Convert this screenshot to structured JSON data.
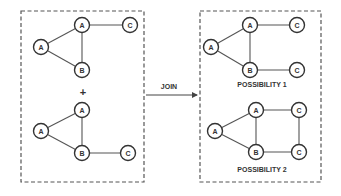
{
  "colors": {
    "stroke": "#555555",
    "node_stroke": "#333333",
    "background": "#ffffff"
  },
  "left_panel": {
    "operator": "+",
    "graph_top": {
      "nodes": [
        {
          "id": "a1",
          "label": "A",
          "x": 41,
          "y": 47
        },
        {
          "id": "a2",
          "label": "A",
          "x": 82,
          "y": 25
        },
        {
          "id": "c1",
          "label": "C",
          "x": 130,
          "y": 25
        },
        {
          "id": "b1",
          "label": "B",
          "x": 82,
          "y": 70
        }
      ],
      "edges": [
        [
          "a1",
          "a2"
        ],
        [
          "a1",
          "b1"
        ],
        [
          "a2",
          "b1"
        ],
        [
          "a2",
          "c1"
        ]
      ]
    },
    "graph_bottom": {
      "nodes": [
        {
          "id": "a1",
          "label": "A",
          "x": 41,
          "y": 131
        },
        {
          "id": "a2",
          "label": "A",
          "x": 82,
          "y": 110
        },
        {
          "id": "b1",
          "label": "B",
          "x": 82,
          "y": 153
        },
        {
          "id": "c1",
          "label": "C",
          "x": 128,
          "y": 153
        }
      ],
      "edges": [
        [
          "a1",
          "a2"
        ],
        [
          "a1",
          "b1"
        ],
        [
          "a2",
          "b1"
        ],
        [
          "b1",
          "c1"
        ]
      ]
    }
  },
  "join": {
    "label": "JOIN"
  },
  "right_panel": {
    "possibility_1": {
      "label": "POSSIBILITY 1",
      "nodes": [
        {
          "id": "a1",
          "label": "A",
          "x": 211,
          "y": 47
        },
        {
          "id": "a2",
          "label": "A",
          "x": 250,
          "y": 25
        },
        {
          "id": "c1",
          "label": "C",
          "x": 297,
          "y": 25
        },
        {
          "id": "b1",
          "label": "B",
          "x": 250,
          "y": 70
        },
        {
          "id": "c2",
          "label": "C",
          "x": 297,
          "y": 70
        }
      ],
      "edges": [
        [
          "a1",
          "a2"
        ],
        [
          "a1",
          "b1"
        ],
        [
          "a2",
          "b1"
        ],
        [
          "a2",
          "c1"
        ],
        [
          "b1",
          "c2"
        ]
      ]
    },
    "possibility_2": {
      "label": "POSSIBILITY 2",
      "nodes": [
        {
          "id": "a1",
          "label": "A",
          "x": 215,
          "y": 131
        },
        {
          "id": "a2",
          "label": "A",
          "x": 256,
          "y": 110
        },
        {
          "id": "c1",
          "label": "C",
          "x": 299,
          "y": 110
        },
        {
          "id": "b1",
          "label": "B",
          "x": 256,
          "y": 152
        },
        {
          "id": "c2",
          "label": "C",
          "x": 299,
          "y": 152
        }
      ],
      "edges": [
        [
          "a1",
          "a2"
        ],
        [
          "a1",
          "b1"
        ],
        [
          "a2",
          "b1"
        ],
        [
          "a2",
          "c1"
        ],
        [
          "b1",
          "c2"
        ],
        [
          "c1",
          "c2"
        ]
      ]
    }
  }
}
